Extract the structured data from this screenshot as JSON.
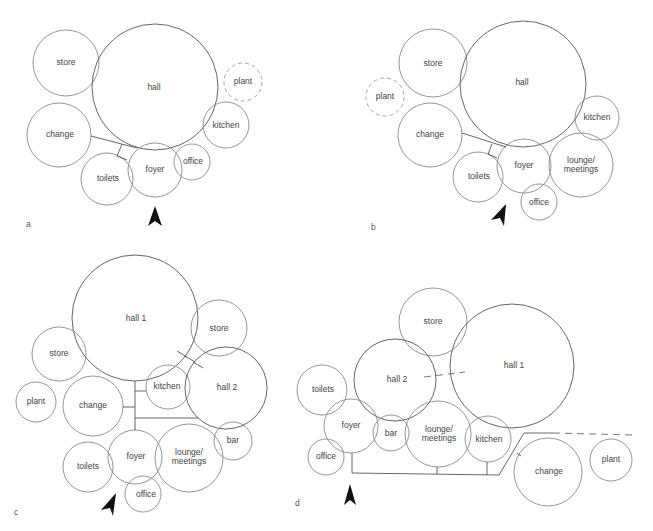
{
  "figure": {
    "panels": [
      {
        "id": "a",
        "label": "a",
        "rooms": [
          {
            "name": "store",
            "label": "store"
          },
          {
            "name": "hall",
            "label": "hall"
          },
          {
            "name": "plant",
            "label": "plant",
            "style": "dashed"
          },
          {
            "name": "kitchen",
            "label": "kitchen"
          },
          {
            "name": "change",
            "label": "change"
          },
          {
            "name": "toilets",
            "label": "toilets"
          },
          {
            "name": "foyer",
            "label": "foyer"
          },
          {
            "name": "office",
            "label": "office"
          }
        ],
        "entrance": "foyer"
      },
      {
        "id": "b",
        "label": "b",
        "rooms": [
          {
            "name": "store",
            "label": "store"
          },
          {
            "name": "hall",
            "label": "hall"
          },
          {
            "name": "plant",
            "label": "plant",
            "style": "dashed"
          },
          {
            "name": "kitchen",
            "label": "kitchen"
          },
          {
            "name": "change",
            "label": "change"
          },
          {
            "name": "toilets",
            "label": "toilets"
          },
          {
            "name": "foyer",
            "label": "foyer"
          },
          {
            "name": "lounge",
            "label_line1": "lounge/",
            "label_line2": "meetings"
          },
          {
            "name": "office",
            "label": "office"
          }
        ],
        "entrance": "foyer"
      },
      {
        "id": "c",
        "label": "c",
        "rooms": [
          {
            "name": "hall-1",
            "label": "hall 1"
          },
          {
            "name": "store-right",
            "label": "store"
          },
          {
            "name": "store-left",
            "label": "store"
          },
          {
            "name": "kitchen",
            "label": "kitchen"
          },
          {
            "name": "hall-2",
            "label": "hall 2"
          },
          {
            "name": "plant",
            "label": "plant"
          },
          {
            "name": "change",
            "label": "change"
          },
          {
            "name": "bar",
            "label": "bar"
          },
          {
            "name": "toilets",
            "label": "toilets"
          },
          {
            "name": "foyer",
            "label": "foyer"
          },
          {
            "name": "lounge",
            "label_line1": "lounge/",
            "label_line2": "meetings"
          },
          {
            "name": "office",
            "label": "office"
          }
        ],
        "entrance": "foyer"
      },
      {
        "id": "d",
        "label": "d",
        "rooms": [
          {
            "name": "store",
            "label": "store"
          },
          {
            "name": "hall-1",
            "label": "hall 1"
          },
          {
            "name": "hall-2",
            "label": "hall 2"
          },
          {
            "name": "toilets",
            "label": "toilets"
          },
          {
            "name": "foyer",
            "label": "foyer"
          },
          {
            "name": "bar",
            "label": "bar"
          },
          {
            "name": "lounge",
            "label_line1": "lounge/",
            "label_line2": "meetings"
          },
          {
            "name": "kitchen",
            "label": "kitchen"
          },
          {
            "name": "office",
            "label": "office"
          },
          {
            "name": "change",
            "label": "change"
          },
          {
            "name": "plant",
            "label": "plant"
          }
        ],
        "entrance": "foyer"
      }
    ]
  }
}
